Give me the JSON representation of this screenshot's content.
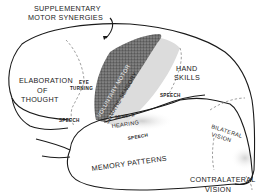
{
  "diagram": {
    "type": "brain-lateral-functional-map",
    "labels": {
      "supplementary_line1": "SUPPLEMENTARY",
      "supplementary_line2": "MOTOR SYNERGIES",
      "elaboration_line1": "ELABORATION",
      "elaboration_line2": "OF",
      "elaboration_line3": "THOUGHT",
      "eye_line1": "EYE",
      "eye_line2": "TURNING",
      "voluntary_motor": "VOLUNTARY MOTOR",
      "somatic_sensory": "SOMATIC SENSORY",
      "hand_skills_line1": "HAND",
      "hand_skills_line2": "SKILLS",
      "speech_frontal": "SPEECH",
      "speech_parietal": "SPEECH",
      "speech_temporal": "SPEECH",
      "sens_ii": "SENS. II",
      "hearing": "HEARING",
      "memory_patterns": "MEMORY PATTERNS",
      "bilateral_line1": "BILATERAL",
      "bilateral_line2": "VISION",
      "contralateral_line1": "CONTRALATERAL",
      "contralateral_line2": "VISION"
    },
    "colors": {
      "outline": "#1a1a1a",
      "motor_strip": "#555555",
      "sensory_strip": "#d8d8d8",
      "background": "#ffffff"
    }
  }
}
